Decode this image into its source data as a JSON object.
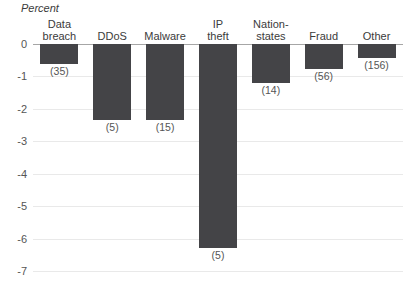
{
  "chart_data": {
    "type": "bar",
    "title": "",
    "subtitle": "",
    "xlabel": "",
    "ylabel": "Percent",
    "ylim": [
      -7,
      0
    ],
    "yticks": [
      0,
      -1,
      -2,
      -3,
      -4,
      -5,
      -6,
      -7
    ],
    "ytick_labels": [
      "0",
      "-1",
      "-2",
      "-3",
      "-4",
      "-5",
      "-6",
      "-7"
    ],
    "grid": true,
    "legend": "none",
    "orientation": "vertical",
    "bar_color": "#444447",
    "gridline_color": "#e9e9e9",
    "zeroline_color": "#a6a6a6",
    "categories": [
      "Data breach",
      "DDoS",
      "Malware",
      "IP theft",
      "Nation-states",
      "Fraud",
      "Other"
    ],
    "category_label_lines": [
      [
        "Data",
        "breach"
      ],
      [
        "DDoS"
      ],
      [
        "Malware"
      ],
      [
        "IP",
        "theft"
      ],
      [
        "Nation-",
        "states"
      ],
      [
        "Fraud"
      ],
      [
        "Other"
      ]
    ],
    "values": [
      -0.62,
      -2.35,
      -2.35,
      -6.3,
      -1.2,
      -0.78,
      -0.42
    ],
    "point_labels": [
      "(35)",
      "(5)",
      "(15)",
      "(5)",
      "(14)",
      "(56)",
      "(156)"
    ]
  }
}
